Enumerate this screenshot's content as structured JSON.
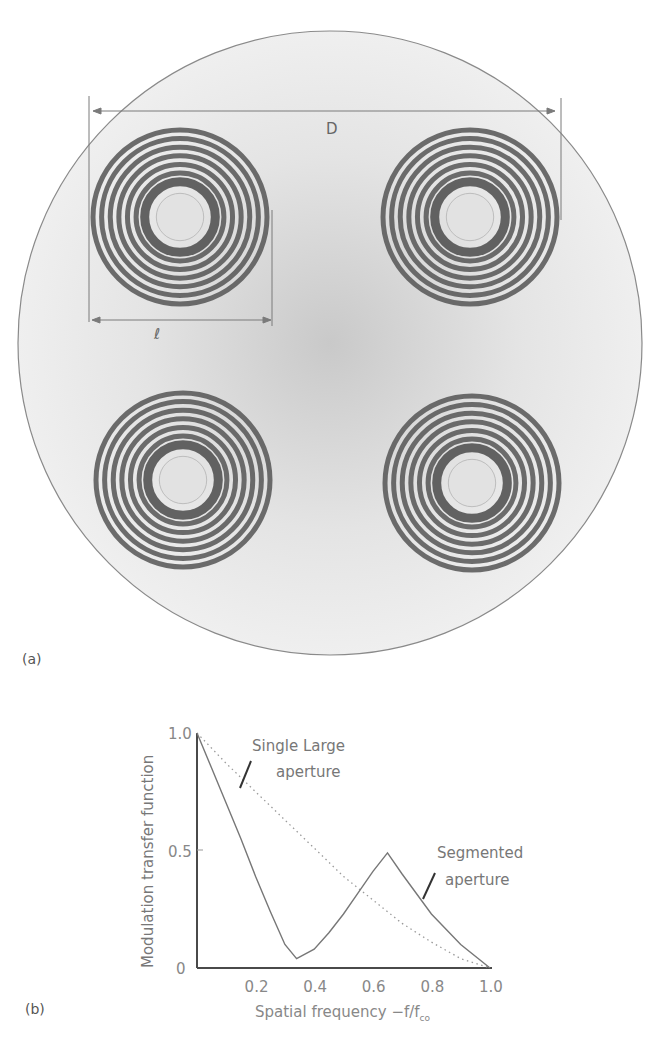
{
  "figure_a": {
    "panel_label": "(a)",
    "dimension_D_label": "D",
    "dimension_l_label": "ℓ",
    "outer_aperture": {
      "cx": 330,
      "cy": 343,
      "r": 312
    },
    "sub_apertures": [
      {
        "name": "top-left",
        "cx": 180,
        "cy": 217,
        "r": 90
      },
      {
        "name": "top-right",
        "cx": 470,
        "cy": 217,
        "r": 90
      },
      {
        "name": "bottom-left",
        "cx": 183,
        "cy": 480,
        "r": 90
      },
      {
        "name": "bottom-right",
        "cx": 472,
        "cy": 483,
        "r": 90
      }
    ],
    "ring_count": 7
  },
  "figure_b": {
    "panel_label": "(b)",
    "annotation_single": [
      "Single Large",
      "aperture"
    ],
    "annotation_segmented": [
      "Segmented",
      "aperture"
    ],
    "x_axis_label": "Spatial frequency −f/f",
    "x_axis_label_sub": "co",
    "y_axis_label": "Modulation transfer function"
  },
  "chart_data": {
    "type": "line",
    "title": "",
    "xlabel": "Spatial frequency −f/f_co",
    "ylabel": "Modulation transfer function",
    "xlim": [
      0,
      1.0
    ],
    "ylim": [
      0,
      1.0
    ],
    "x_ticks": [
      "0.2",
      "0.4",
      "0.6",
      "0.8",
      "1.0"
    ],
    "y_ticks": [
      "0",
      "0.5",
      "1.0"
    ],
    "grid": false,
    "series": [
      {
        "name": "Single Large aperture",
        "style": "dotted",
        "x": [
          0,
          0.1,
          0.2,
          0.3,
          0.4,
          0.5,
          0.6,
          0.7,
          0.8,
          0.9,
          1.0
        ],
        "values": [
          1.0,
          0.87,
          0.75,
          0.63,
          0.51,
          0.39,
          0.29,
          0.19,
          0.11,
          0.04,
          0.0
        ]
      },
      {
        "name": "Segmented aperture",
        "style": "solid",
        "x": [
          0,
          0.05,
          0.1,
          0.15,
          0.2,
          0.25,
          0.3,
          0.34,
          0.4,
          0.45,
          0.5,
          0.55,
          0.6,
          0.65,
          0.7,
          0.8,
          0.9,
          1.0
        ],
        "values": [
          1.0,
          0.85,
          0.7,
          0.55,
          0.39,
          0.24,
          0.1,
          0.04,
          0.08,
          0.15,
          0.23,
          0.32,
          0.41,
          0.49,
          0.4,
          0.23,
          0.1,
          0.0
        ]
      }
    ]
  }
}
